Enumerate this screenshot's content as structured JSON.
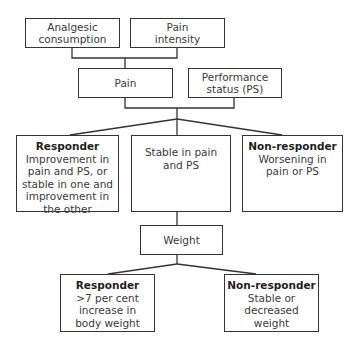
{
  "level1": {
    "analgesic": "Analgesic consumption",
    "pain_intensity": "Pain intensity"
  },
  "level2": {
    "pain": "Pain",
    "performance_status": "Performance status (PS)"
  },
  "level3": {
    "responder": {
      "title": "Responder",
      "text": "Improvement in pain and PS, or stable in one and improvement in the other"
    },
    "stable": {
      "text": "Stable in pain and PS"
    },
    "non_responder": {
      "title": "Non-responder",
      "text": "Worsening in pain or PS"
    }
  },
  "level4": {
    "weight": "Weight"
  },
  "level5": {
    "responder": {
      "title": "Responder",
      "text": ">7 per cent increase in body weight"
    },
    "non_responder": {
      "title": "Non-responder",
      "text": "Stable or decreased weight"
    }
  }
}
